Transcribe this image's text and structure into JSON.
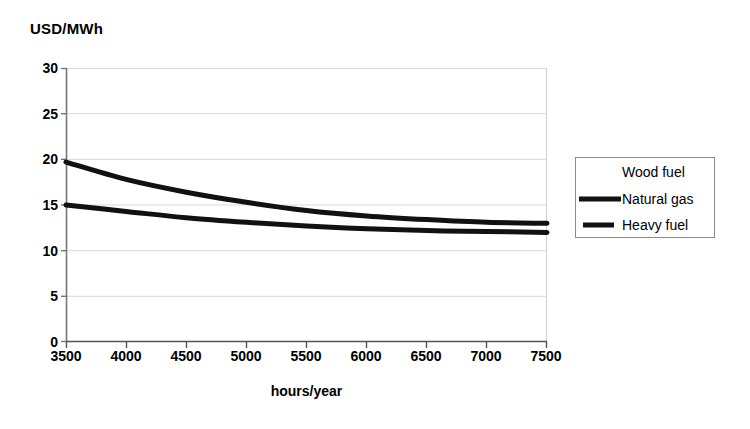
{
  "chart_data": {
    "type": "line",
    "title": "",
    "ylabel": "USD/MWh",
    "xlabel": "hours/year",
    "xlim": [
      3500,
      7500
    ],
    "ylim": [
      0,
      30
    ],
    "xticks": [
      3500,
      4000,
      4500,
      5000,
      5500,
      6000,
      6500,
      7000,
      7500
    ],
    "yticks": [
      0,
      5,
      10,
      15,
      20,
      25,
      30
    ],
    "grid": true,
    "grid_color": "#d8d8d8",
    "legend_position": "right",
    "x": [
      3500,
      4000,
      4500,
      5000,
      5500,
      6000,
      6500,
      7000,
      7500
    ],
    "series": [
      {
        "name": "Wood fuel",
        "color": "#ffffff",
        "width": 4,
        "visible": false,
        "values": [
          null,
          null,
          null,
          null,
          null,
          null,
          null,
          null,
          null
        ]
      },
      {
        "name": "Natural gas",
        "color": "#111111",
        "width": 5,
        "visible": true,
        "values": [
          19.7,
          17.8,
          16.4,
          15.3,
          14.4,
          13.8,
          13.4,
          13.1,
          13.0
        ]
      },
      {
        "name": "Heavy fuel",
        "color": "#111111",
        "width": 5,
        "visible": true,
        "values": [
          15.0,
          14.3,
          13.6,
          13.1,
          12.7,
          12.4,
          12.2,
          12.1,
          12.0
        ]
      }
    ]
  },
  "axis": {
    "y_unit_label": "USD/MWh",
    "x_axis_title": "hours/year",
    "y_tick_labels": [
      "30",
      "25",
      "20",
      "15",
      "10",
      "5",
      "0"
    ],
    "x_tick_labels": [
      "3500",
      "4000",
      "4500",
      "5000",
      "5500",
      "6000",
      "6500",
      "7000",
      "7500"
    ]
  },
  "legend": {
    "entries": [
      {
        "label": "Wood fuel",
        "swatch": "line-swatch-white"
      },
      {
        "label": "Natural gas",
        "swatch": "line-swatch-black-long"
      },
      {
        "label": "Heavy fuel",
        "swatch": "line-swatch-black-short"
      }
    ]
  }
}
